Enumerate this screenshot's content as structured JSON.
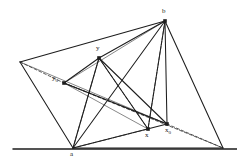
{
  "figure": {
    "type": "geometry-diagram",
    "background_color": "#ffffff",
    "stroke_color": "#1d1d1d",
    "stroke_color_light": "#6a6a6a",
    "width": 237,
    "height": 165,
    "points": [
      {
        "id": "b",
        "label": "b",
        "x": 165,
        "y": 21,
        "label_x": 162,
        "label_y": 8,
        "marker": "square"
      },
      {
        "id": "y",
        "label": "y",
        "x": 99,
        "y": 58,
        "label_x": 96,
        "label_y": 45,
        "marker": "square"
      },
      {
        "id": "y0",
        "label": "y",
        "sub": "0",
        "x": 64,
        "y": 83,
        "label_x": 52,
        "label_y": 75,
        "marker": "square"
      },
      {
        "id": "a",
        "label": "a",
        "x": 73,
        "y": 148,
        "label_x": 70,
        "label_y": 151,
        "marker": "none"
      },
      {
        "id": "x",
        "label": "x",
        "x": 148,
        "y": 129,
        "label_x": 145,
        "label_y": 132,
        "marker": "square"
      },
      {
        "id": "x0",
        "label": "x",
        "sub": "0",
        "x": 167,
        "y": 124,
        "label_x": 165,
        "label_y": 127,
        "marker": "square"
      },
      {
        "id": "L",
        "label": "",
        "x": 20,
        "y": 62,
        "marker": "none"
      },
      {
        "id": "R",
        "label": "",
        "x": 223,
        "y": 148,
        "marker": "none"
      }
    ],
    "baseline": {
      "x1": 13,
      "y1": 149,
      "x2": 237,
      "y2": 149
    },
    "solid_segments": [
      {
        "name": "outer-L-b",
        "from": "L",
        "to": "b"
      },
      {
        "name": "outer-b-R",
        "from": "b",
        "to": "R"
      },
      {
        "name": "outer-L-a",
        "from": "L",
        "to": "a"
      },
      {
        "name": "outer-a-R",
        "from": "a",
        "to": "R"
      },
      {
        "name": "a-b",
        "from": "a",
        "to": "b"
      },
      {
        "name": "a-y",
        "from": "a",
        "to": "y"
      },
      {
        "name": "y-b",
        "from": "y",
        "to": "b"
      },
      {
        "name": "a-x0",
        "from": "a",
        "to": "x0"
      },
      {
        "name": "x0-b",
        "from": "x0",
        "to": "b"
      },
      {
        "name": "x-b",
        "from": "x",
        "to": "b"
      },
      {
        "name": "y-x0",
        "from": "y",
        "to": "x0"
      },
      {
        "name": "y-x",
        "from": "y",
        "to": "x"
      },
      {
        "name": "y0-y",
        "from": "y0",
        "to": "y"
      },
      {
        "name": "y0-x0",
        "from": "y0",
        "to": "x0"
      }
    ],
    "light_segments": [
      {
        "name": "y0-b-light",
        "from": "y0",
        "to": "b"
      },
      {
        "name": "y0-x-light",
        "from": "y0",
        "to": "x"
      },
      {
        "name": "L-x0-light",
        "from": "L",
        "to": "x0"
      }
    ],
    "dashed_segments": [
      {
        "name": "L-y0-dash",
        "from": "L",
        "to": "y0"
      },
      {
        "name": "y0-x0-dash",
        "from": "y0",
        "to": "x0"
      },
      {
        "name": "x0-R-dash",
        "from": "x0",
        "to": "R"
      },
      {
        "name": "a-y-dash",
        "from": "a",
        "to": "y"
      },
      {
        "name": "a-x-dash",
        "from": "a",
        "to": "x"
      },
      {
        "name": "y-x-dash",
        "from": "y",
        "to": "x"
      },
      {
        "name": "b-x-dash",
        "from": "b",
        "to": "x"
      },
      {
        "name": "y0-R-dash",
        "from": "y0",
        "to": "R"
      }
    ]
  }
}
